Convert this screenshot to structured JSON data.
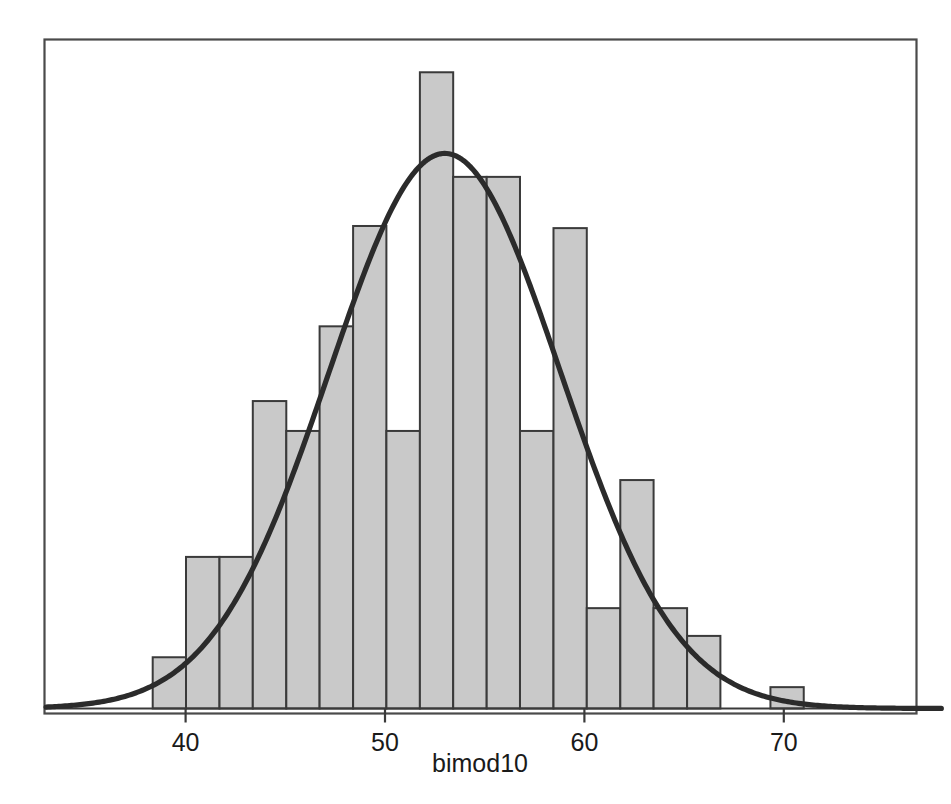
{
  "chart_data": {
    "type": "bar",
    "title": "",
    "subtitle": "",
    "xlabel": "bimod10",
    "ylabel": "",
    "xlim": [
      33.0,
      77.9
    ],
    "ylim": [
      0,
      32
    ],
    "grid": false,
    "legend": null,
    "xticks": [
      40,
      50,
      60,
      70
    ],
    "xtick_labels": [
      "40",
      "50",
      "60",
      "70"
    ],
    "bin_width": 1.675,
    "bar_fill": "#c9c9c9",
    "bar_edge": "#3a3a3a",
    "curve_color": "#2b2b2b",
    "frame_color": "#4a4a4a",
    "background": "#ffffff",
    "bins": [
      {
        "x0": 38.35,
        "x1": 40.02,
        "center": 39.19,
        "value": 2.4
      },
      {
        "x0": 40.02,
        "x1": 41.7,
        "center": 40.86,
        "value": 7.1
      },
      {
        "x0": 41.7,
        "x1": 43.37,
        "center": 42.54,
        "value": 7.1
      },
      {
        "x0": 43.37,
        "x1": 45.05,
        "center": 44.21,
        "value": 14.4
      },
      {
        "x0": 45.05,
        "x1": 46.72,
        "center": 45.89,
        "value": 13.0
      },
      {
        "x0": 46.72,
        "x1": 48.4,
        "center": 47.56,
        "value": 17.9
      },
      {
        "x0": 48.4,
        "x1": 50.07,
        "center": 49.24,
        "value": 22.6
      },
      {
        "x0": 50.07,
        "x1": 51.75,
        "center": 50.91,
        "value": 13.0
      },
      {
        "x0": 51.75,
        "x1": 53.42,
        "center": 52.59,
        "value": 29.8
      },
      {
        "x0": 53.42,
        "x1": 55.1,
        "center": 54.26,
        "value": 24.9
      },
      {
        "x0": 55.1,
        "x1": 56.77,
        "center": 55.94,
        "value": 24.9
      },
      {
        "x0": 56.77,
        "x1": 58.45,
        "center": 57.61,
        "value": 13.0
      },
      {
        "x0": 58.45,
        "x1": 60.12,
        "center": 59.29,
        "value": 22.5
      },
      {
        "x0": 60.12,
        "x1": 61.8,
        "center": 60.96,
        "value": 4.7
      },
      {
        "x0": 61.8,
        "x1": 63.47,
        "center": 62.64,
        "value": 10.7
      },
      {
        "x0": 63.47,
        "x1": 65.15,
        "center": 64.31,
        "value": 4.7
      },
      {
        "x0": 65.15,
        "x1": 66.82,
        "center": 65.99,
        "value": 3.4
      },
      {
        "x0": 69.33,
        "x1": 71.0,
        "center": 70.17,
        "value": 1.0
      }
    ],
    "curve": {
      "label": "normal density overlay",
      "mean": 53.0,
      "sd": 5.8,
      "peak_value": 26.0
    }
  },
  "axis": {
    "x_axis_title": "bimod10"
  }
}
